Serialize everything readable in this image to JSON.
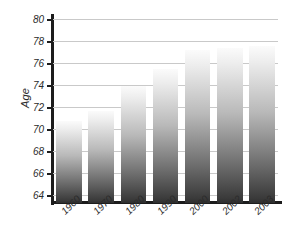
{
  "chart_data": {
    "type": "bar",
    "title": "",
    "xlabel": "",
    "ylabel": "Age",
    "categories": [
      "1960",
      "1970",
      "1980",
      "1990",
      "2000",
      "2002",
      "2003"
    ],
    "values": [
      70.8,
      71.7,
      73.9,
      75.5,
      77.2,
      77.4,
      77.6
    ],
    "ylim": [
      63.3,
      80.3
    ],
    "yticks": [
      64,
      66,
      68,
      70,
      72,
      74,
      76,
      78,
      80
    ],
    "ytick_labels": [
      "64",
      "66",
      "68",
      "70",
      "72",
      "74",
      "76",
      "78",
      "80"
    ],
    "grid": true,
    "legend": null,
    "series": [
      {
        "name": "Age",
        "values": [
          70.8,
          71.7,
          73.9,
          75.5,
          77.2,
          77.4,
          77.6
        ]
      }
    ]
  },
  "axis": {
    "y_title": "Age"
  },
  "style": {
    "bar_top_color": "#fbfbfb",
    "bar_bottom_color": "#333333",
    "gridline_color": "#c9c9c9",
    "axis_color": "#1c1c1c",
    "text_color": "#2b2b2b",
    "background": "#ffffff"
  }
}
